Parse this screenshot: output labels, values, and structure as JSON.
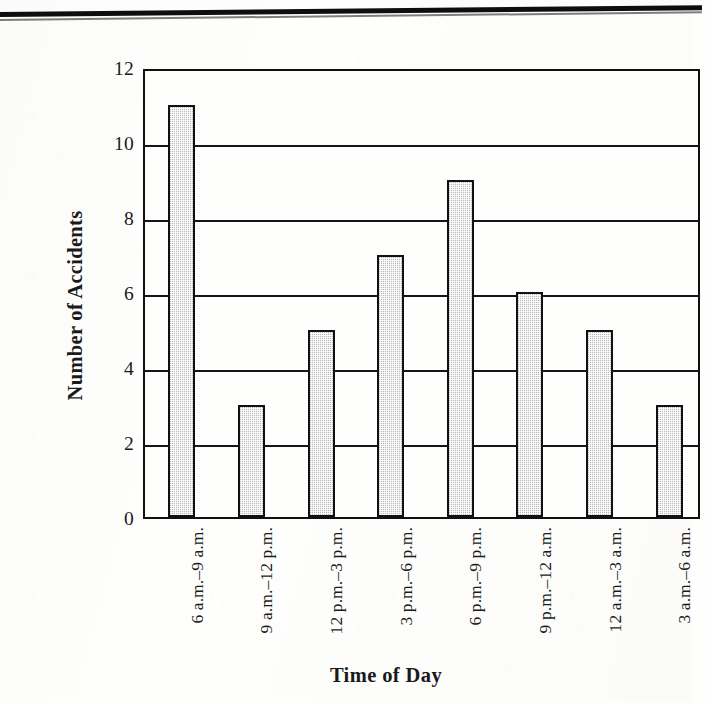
{
  "page": {
    "kind": "scanned-textbook-figure",
    "top_rule": "horizontal-rule"
  },
  "chart_data": {
    "type": "bar",
    "title": "",
    "subtitle": "",
    "xlabel": "Time of Day",
    "ylabel": "Number of Accidents",
    "categories": [
      "6 a.m.–9 a.m.",
      "9 a.m.–12 p.m.",
      "12 p.m.–3 p.m.",
      "3 p.m.–6 p.m.",
      "6 p.m.–9 p.m.",
      "9 p.m.–12 a.m.",
      "12 a.m.–3 a.m.",
      "3 a.m.–6 a.m."
    ],
    "values": [
      11,
      3,
      5,
      7,
      9,
      6,
      5,
      3
    ],
    "ylim": [
      0,
      12
    ],
    "ytick_labels": [
      "0",
      "2",
      "4",
      "6",
      "8",
      "10",
      "12"
    ],
    "ytick_values": [
      0,
      2,
      4,
      6,
      8,
      10,
      12
    ],
    "grid": "horizontal",
    "legend": "none",
    "bar_fill_color": "#b9b9b9",
    "bar_edge_color": "#111111",
    "axis_color": "#111111",
    "background_color": "#fefefd"
  }
}
